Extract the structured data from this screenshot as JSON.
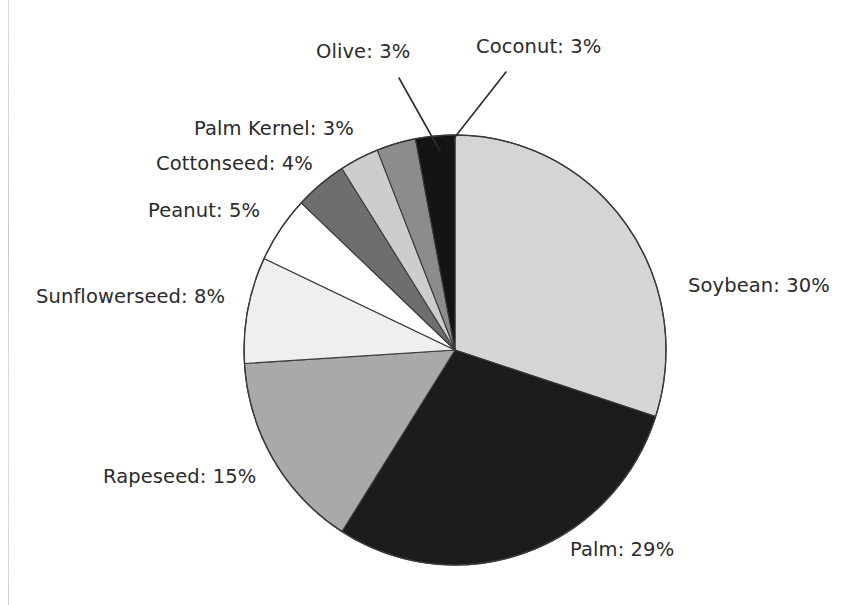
{
  "figure": {
    "background_color": "#ffffff",
    "text_color": "#2b2b2b",
    "outline_color": "#3a3a3a"
  },
  "chart_data": {
    "type": "pie",
    "title": "",
    "subtitle": "",
    "xlabel": "",
    "ylabel": "",
    "grid": false,
    "legend_position": "none",
    "labels_placement": "outside-with-leader-lines",
    "start_angle_deg": 90,
    "direction": "clockwise",
    "units": "percent",
    "total": 100,
    "categories": [
      "Soybean",
      "Palm",
      "Rapeseed",
      "Sunflowerseed",
      "Peanut",
      "Cottonseed",
      "Palm Kernel",
      "Olive",
      "Coconut"
    ],
    "values": [
      30,
      29,
      15,
      8,
      5,
      4,
      3,
      3,
      3
    ],
    "slices": [
      {
        "name": "Soybean",
        "value": 30,
        "label": "Soybean: 30%",
        "color": "#d5d5d5",
        "leader_line": false
      },
      {
        "name": "Palm",
        "value": 29,
        "label": "Palm: 29%",
        "color": "#1c1c1c",
        "leader_line": false
      },
      {
        "name": "Rapeseed",
        "value": 15,
        "label": "Rapeseed: 15%",
        "color": "#a9a9a9",
        "leader_line": false
      },
      {
        "name": "Sunflowerseed",
        "value": 8,
        "label": "Sunflowerseed: 8%",
        "color": "#efefef",
        "leader_line": false
      },
      {
        "name": "Peanut",
        "value": 5,
        "label": "Peanut: 5%",
        "color": "#ffffff",
        "leader_line": false
      },
      {
        "name": "Cottonseed",
        "value": 4,
        "label": "Cottonseed: 4%",
        "color": "#6e6e6e",
        "leader_line": false
      },
      {
        "name": "Palm Kernel",
        "value": 3,
        "label": "Palm Kernel: 3%",
        "color": "#cdcdcd",
        "leader_line": false
      },
      {
        "name": "Olive",
        "value": 3,
        "label": "Olive: 3%",
        "color": "#8c8c8c",
        "leader_line": true
      },
      {
        "name": "Coconut",
        "value": 3,
        "label": "Coconut: 3%",
        "color": "#141414",
        "leader_line": true
      }
    ]
  }
}
